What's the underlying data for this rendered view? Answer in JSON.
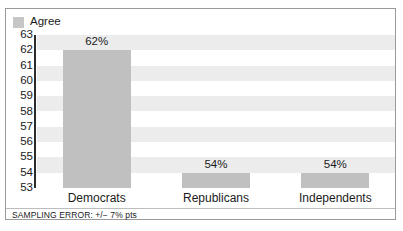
{
  "legend": {
    "items": [
      {
        "label": "Agree",
        "color": "#c6c6c6",
        "swatch_name": "legend-swatch-agree"
      }
    ],
    "position": "top-left"
  },
  "footer": {
    "sampling_error": "SAMPLING ERROR: +/− 7% pts"
  },
  "colors": {
    "bar": "#c0c0c0",
    "band": "#ececec",
    "axis": "#2b2b2b",
    "frame_border": "#9a9a9a",
    "text": "#1b1b1b",
    "background": "#ffffff"
  },
  "chart_data": {
    "type": "bar",
    "title": "",
    "xlabel": "",
    "ylabel": "",
    "categories": [
      "Democrats",
      "Republicans",
      "Independents"
    ],
    "values": [
      62,
      54,
      54
    ],
    "value_labels": [
      "62%",
      "54%",
      "54%"
    ],
    "series": [
      {
        "name": "Agree",
        "values": [
          62,
          54,
          54
        ]
      }
    ],
    "ylim": [
      53,
      63
    ],
    "ytick_values": [
      63,
      62,
      61,
      60,
      59,
      58,
      57,
      56,
      55,
      54,
      53
    ],
    "ytick_labels": [
      "63",
      "62",
      "61",
      "60",
      "59",
      "58",
      "57",
      "56",
      "55",
      "54",
      "53"
    ],
    "grid": false,
    "banding": true,
    "legend_position": "top-left",
    "annotations": [
      "SAMPLING ERROR: +/− 7% pts"
    ]
  }
}
